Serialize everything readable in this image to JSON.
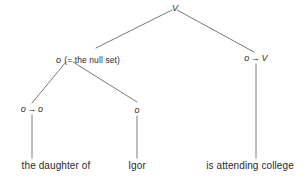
{
  "figure": {
    "type": "syntactic-category-tree",
    "sentence": "the daughter of Igor is attending college",
    "line_color": "#6b6b6b",
    "text_color": "#2b2b2b",
    "background": "#ffffff"
  },
  "nodes": {
    "root": {
      "label": "V"
    },
    "subject": {
      "category": "o",
      "gloss": "(= the null set)"
    },
    "predicate": {
      "label": "o → V",
      "left": "o",
      "arrow": "→",
      "right": "V"
    },
    "determiner": {
      "label": "o → o",
      "left": "o",
      "arrow": "→",
      "right": "o"
    },
    "argument": {
      "label": "o"
    }
  },
  "leaves": [
    {
      "text": "the daughter of"
    },
    {
      "text": "Igor"
    },
    {
      "text": "is attending college"
    }
  ],
  "edges": [
    {
      "from": "root",
      "to": "subject"
    },
    {
      "from": "root",
      "to": "predicate"
    },
    {
      "from": "subject",
      "to": "determiner"
    },
    {
      "from": "subject",
      "to": "argument"
    },
    {
      "from": "determiner",
      "to": "leaf-the-daughter-of"
    },
    {
      "from": "argument",
      "to": "leaf-igor"
    },
    {
      "from": "predicate",
      "to": "leaf-is-attending-college"
    }
  ]
}
